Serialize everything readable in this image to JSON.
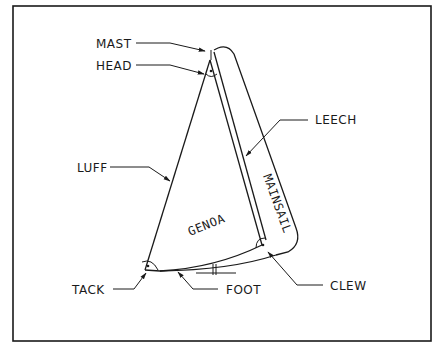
{
  "diagram": {
    "labels": {
      "mast": "MAST",
      "head": "HEAD",
      "leech": "LEECH",
      "luff": "LUFF",
      "genoa": "GENOA",
      "mainsail": "MAINSAIL",
      "tack": "TACK",
      "foot": "FOOT",
      "clew": "CLEW"
    },
    "colors": {
      "line": "#1a1a1a",
      "background": "#ffffff"
    }
  }
}
